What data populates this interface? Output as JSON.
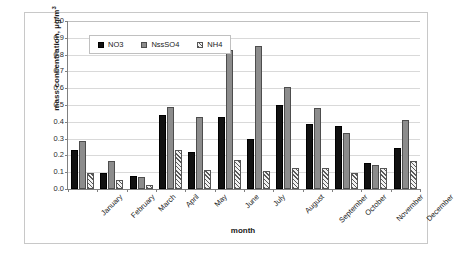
{
  "chart_data": {
    "type": "bar",
    "title": "",
    "subtitle": "",
    "xlabel": "month",
    "ylabel": "mass concentration, µg/m³",
    "ylabel_main": "mass concentration, µg/m",
    "ylabel_exponent": "3",
    "ylim": [
      0,
      1.0
    ],
    "ytick_step": 0.1,
    "yticks": [
      "1.0",
      "0.9",
      "0.8",
      "0.7",
      "0.6",
      "0.5",
      "0.4",
      "0.3",
      "0.2",
      "0.1",
      "0.0"
    ],
    "ytick_values": [
      1.0,
      0.9,
      0.8,
      0.7,
      0.6,
      0.5,
      0.4,
      0.3,
      0.2,
      0.1,
      0.0
    ],
    "grid": true,
    "grid_axis": "y",
    "legend_position": "top-left-inside",
    "categories": [
      "January",
      "February",
      "March",
      "April",
      "May",
      "June",
      "July",
      "August",
      "September",
      "October",
      "November",
      "December"
    ],
    "series": [
      {
        "name": "NO3",
        "color": "#111111",
        "pattern": "solid",
        "values": [
          0.235,
          0.095,
          0.078,
          0.44,
          0.22,
          0.43,
          0.295,
          0.5,
          0.385,
          0.375,
          0.155,
          0.245
        ]
      },
      {
        "name": "NssSO4",
        "color": "#8c8c8c",
        "pattern": "solid",
        "values": [
          0.285,
          0.165,
          0.072,
          0.49,
          0.43,
          0.83,
          0.85,
          0.605,
          0.48,
          0.335,
          0.14,
          0.41
        ]
      },
      {
        "name": "NH4",
        "color": "#f2f2f2",
        "pattern": "diagonal-hatch",
        "values": [
          0.095,
          0.055,
          0.022,
          0.23,
          0.115,
          0.175,
          0.105,
          0.125,
          0.125,
          0.095,
          0.125,
          0.165
        ]
      }
    ]
  },
  "colors": {
    "no3": "#111111",
    "nsso4": "#8c8c8c",
    "nh4": "#f2f2f2",
    "gridline": "#d9d9d9",
    "axis": "#808080",
    "frame": "#c8c8c8",
    "background": "#ffffff"
  }
}
